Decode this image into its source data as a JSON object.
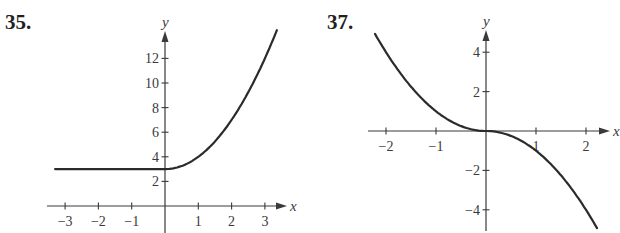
{
  "header_fragment": "(√x)",
  "chart_data": [
    {
      "type": "line",
      "label": "35.",
      "title": "",
      "xlabel": "x",
      "ylabel": "y",
      "xlim": [
        -3.3,
        3.6
      ],
      "ylim": [
        0,
        14
      ],
      "x_ticks": [
        -3,
        -2,
        -1,
        1,
        2,
        3
      ],
      "x_tick_labels": [
        "−3",
        "−2",
        "−1",
        "1",
        "2",
        "3"
      ],
      "y_ticks": [
        2,
        4,
        6,
        8,
        10,
        12
      ],
      "y_tick_labels": [
        "2",
        "4",
        "6",
        "8",
        "10",
        "12"
      ],
      "grid": false,
      "legend": null,
      "description": "Piecewise: y = 3 for x < 0, y = 3 + x^2 for x >= 0",
      "series": [
        {
          "name": "curve",
          "x": [
            -3.3,
            -3,
            -2,
            -1,
            0,
            0.5,
            1,
            1.5,
            2,
            2.5,
            3,
            3.36
          ],
          "y": [
            3,
            3,
            3,
            3,
            3,
            3.25,
            4,
            5.25,
            7,
            9.25,
            12,
            14.3
          ]
        }
      ],
      "pixel_frame": {
        "origin_x": 165,
        "origin_y": 206,
        "px_per_x": 33.3,
        "px_per_y": 12.3,
        "axis_left": 47,
        "axis_right": 287,
        "axis_top": 31,
        "axis_bottom": 233
      }
    },
    {
      "type": "line",
      "label": "37.",
      "title": "",
      "xlabel": "x",
      "ylabel": "y",
      "xlim": [
        -2.2,
        2.45
      ],
      "ylim": [
        -5,
        5
      ],
      "x_ticks": [
        -2,
        -1,
        1,
        2
      ],
      "x_tick_labels": [
        "−2",
        "−1",
        "1",
        "2"
      ],
      "y_ticks": [
        -4,
        -2,
        2,
        4
      ],
      "y_tick_labels": [
        "−4",
        "−2",
        "2",
        "4"
      ],
      "grid": false,
      "legend": null,
      "description": "Odd function y = -x|x|, decreasing, flat at origin",
      "series": [
        {
          "name": "curve",
          "x": [
            -2.22,
            -2,
            -1.5,
            -1,
            -0.5,
            0,
            0.5,
            1,
            1.5,
            2,
            2.22
          ],
          "y": [
            4.93,
            4,
            2.25,
            1,
            0.25,
            0,
            -0.25,
            -1,
            -2.25,
            -4,
            -4.93
          ]
        }
      ],
      "pixel_frame": {
        "origin_x": 486,
        "origin_y": 131,
        "px_per_x": 50,
        "px_per_y": 19.7,
        "axis_left": 368,
        "axis_right": 610,
        "axis_top": 30,
        "axis_bottom": 231
      }
    }
  ]
}
